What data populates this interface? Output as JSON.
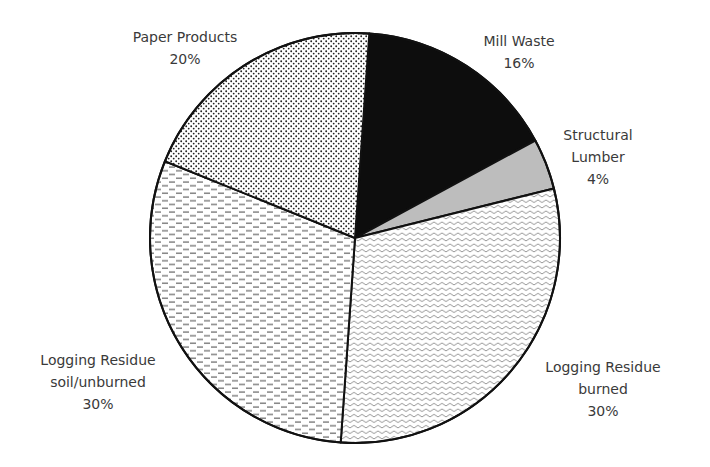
{
  "chart_data": {
    "type": "pie",
    "title": "",
    "start_angle_deg": 4,
    "direction": "clockwise",
    "center": [
      355,
      238
    ],
    "radius": 205,
    "slices": [
      {
        "label": "Mill Waste",
        "label_lines": [
          "Mill Waste"
        ],
        "value": 16,
        "display": "16%",
        "fill": "#0d0d0d",
        "pattern": "solid-black",
        "label_pos": [
          519,
          46
        ]
      },
      {
        "label": "Structural Lumber",
        "label_lines": [
          "Structural",
          "Lumber"
        ],
        "value": 4,
        "display": "4%",
        "fill": "#bdbdbd",
        "pattern": "solid-gray",
        "label_pos": [
          598,
          140
        ]
      },
      {
        "label": "Logging Residue burned",
        "label_lines": [
          "Logging Residue",
          "burned"
        ],
        "value": 30,
        "display": "30%",
        "fill": "#ffffff",
        "pattern": "waves",
        "label_pos": [
          603,
          372
        ]
      },
      {
        "label": "Logging Residue soil/unburned",
        "label_lines": [
          "Logging Residue",
          "soil/unburned"
        ],
        "value": 30,
        "display": "30%",
        "fill": "#ffffff",
        "pattern": "dashes",
        "label_pos": [
          98,
          365
        ]
      },
      {
        "label": "Paper Products",
        "label_lines": [
          "Paper Products"
        ],
        "value": 20,
        "display": "20%",
        "fill": "#ffffff",
        "pattern": "dots",
        "label_pos": [
          185,
          42
        ]
      }
    ],
    "legend": "none (direct labels)",
    "outline_color": "#111111"
  }
}
